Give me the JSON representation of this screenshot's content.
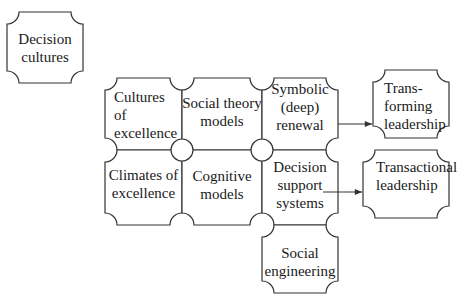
{
  "nodes": {
    "decision_cultures": {
      "lines": [
        "Decision",
        "cultures"
      ]
    },
    "cultures_of_excellence": {
      "lines": [
        "Cultures",
        "of",
        "excellence"
      ]
    },
    "social_theory_models": {
      "lines": [
        "Social theory",
        "models"
      ]
    },
    "symbolic_renewal": {
      "lines": [
        "Symbolic",
        "(deep)",
        "renewal"
      ]
    },
    "climates_of_excellence": {
      "lines": [
        "Climates of",
        "excellence"
      ]
    },
    "cognitive_models": {
      "lines": [
        "Cognitive",
        "models"
      ]
    },
    "decision_support_systems": {
      "lines": [
        "Decision",
        "support",
        "systems"
      ]
    },
    "social_engineering": {
      "lines": [
        "Social",
        "engineering"
      ]
    },
    "transforming_leadership": {
      "lines": [
        "Trans-",
        "forming",
        "leadership"
      ]
    },
    "transactional_leadership": {
      "lines": [
        "Transactional",
        "leadership"
      ]
    }
  },
  "edges": [
    {
      "from": "Symbolic (deep) renewal",
      "to": "Trans-forming leadership"
    },
    {
      "from": "Decision support systems",
      "to": "Transactional leadership"
    }
  ],
  "colors": {
    "stroke": "#333333",
    "fill": "#ffffff",
    "text": "#1a1a1a"
  }
}
